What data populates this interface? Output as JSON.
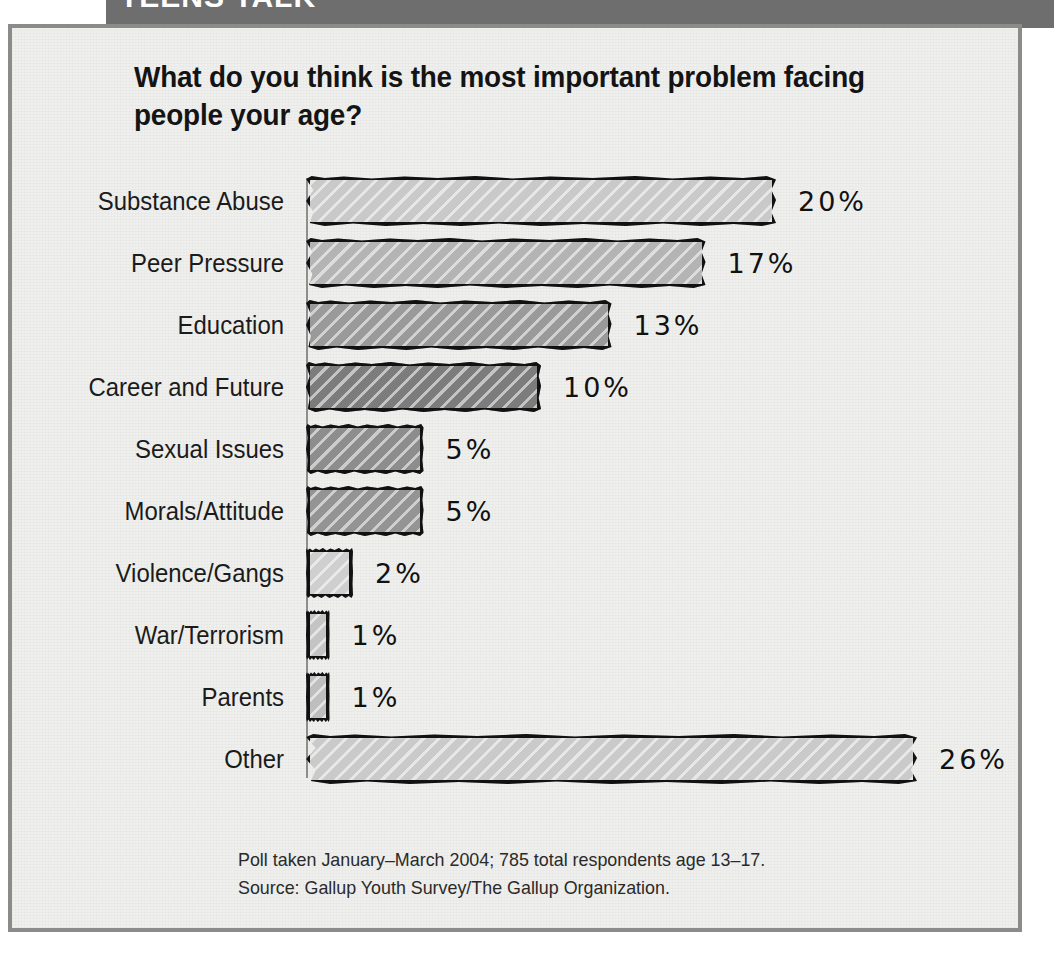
{
  "banner": {
    "text": "TEENS TALK"
  },
  "title": "What do you think is the most important problem facing people your age?",
  "footnote": {
    "line1": "Poll taken January–March 2004; 785 total respondents age 13–17.",
    "line2": "Source: Gallup Youth Survey/The Gallup Organization."
  },
  "chart_data": {
    "type": "bar",
    "orientation": "horizontal",
    "title": "What do you think is the most important problem facing people your age?",
    "xlabel": "",
    "ylabel": "",
    "xlim": [
      0,
      26
    ],
    "grid": false,
    "legend": "none",
    "unit": "%",
    "categories": [
      "Substance Abuse",
      "Peer Pressure",
      "Education",
      "Career and Future",
      "Sexual Issues",
      "Morals/Attitude",
      "Violence/Gangs",
      "War/Terrorism",
      "Parents",
      "Other"
    ],
    "values": [
      20,
      17,
      13,
      10,
      5,
      5,
      2,
      1,
      1,
      26
    ],
    "value_labels": [
      "20%",
      "17%",
      "13%",
      "10%",
      "5%",
      "5%",
      "2%",
      "1%",
      "1%",
      "26%"
    ],
    "bar_colors": [
      "#c9c9c9",
      "#b4b4b4",
      "#9a9a9a",
      "#7c7c7c",
      "#8d8d8d",
      "#949494",
      "#cfcfcf",
      "#c4c4c4",
      "#bebebe",
      "#cacaca"
    ],
    "annotations": [
      "Poll taken January–March 2004; 785 total respondents age 13–17.",
      "Source: Gallup Youth Survey/The Gallup Organization."
    ]
  },
  "colors": {
    "banner": "#6e6e6e",
    "frame_border": "#8a8c8a",
    "page_background": "#eff0ee",
    "axis": "#8d8f8d",
    "outline": "#111111",
    "text": "#141414"
  }
}
